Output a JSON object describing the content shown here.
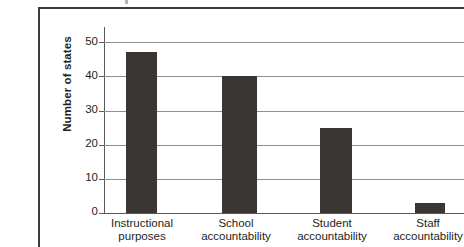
{
  "chart_data": {
    "type": "bar",
    "title": "",
    "subtitle": "",
    "xlabel": "",
    "ylabel": "Number of states",
    "ylim": [
      0,
      55
    ],
    "yticks": [
      0,
      10,
      20,
      30,
      40,
      50
    ],
    "ytick_labels": [
      "0",
      "10",
      "20",
      "30",
      "40",
      "50"
    ],
    "grid": "horizontal",
    "legend": "none",
    "bar_color": "#3a3634",
    "gridline_color": "#8e8e8e",
    "axis_color": "#5a5a5a",
    "frame_color": "#3c3c3c",
    "categories": [
      "Instructional purposes",
      "School accountability",
      "Student accountability",
      "Staff accountability"
    ],
    "category_lines": [
      [
        "Instructional",
        "purposes"
      ],
      [
        "School",
        "accountability"
      ],
      [
        "Student",
        "accountability"
      ],
      [
        "Staff",
        "accountability"
      ]
    ],
    "values": [
      47,
      40,
      25,
      3
    ],
    "series": [
      {
        "name": "Number of states",
        "values": [
          47,
          40,
          25,
          3
        ]
      }
    ]
  }
}
